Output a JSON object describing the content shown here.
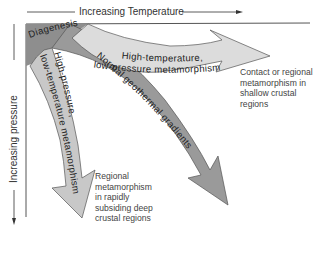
{
  "axes": {
    "x_label": "Increasing Temperature",
    "y_label": "Increasing pressure"
  },
  "regions": {
    "diagenesis": "Diagenesis"
  },
  "arrows": [
    {
      "id": "high-temp-low-pressure",
      "line1": "High-temperature,",
      "line2": "low-pressure metamorphism",
      "color": "#dcdcdc"
    },
    {
      "id": "normal-geothermal",
      "label": "Normal geothermal gradients",
      "color": "#9a9a9a"
    },
    {
      "id": "high-pressure-low-temp",
      "line1": "High-pressure,",
      "line2": "low-temperature metamorphism",
      "color": "#c8c8c8"
    }
  ],
  "notes": {
    "contact": [
      "Contact or regional",
      "metamorphism in",
      "shallow crustal",
      "regions"
    ],
    "regional": [
      "Regional",
      "metamorphism",
      "in rapidly",
      "subsiding deep",
      "crustal regions"
    ]
  },
  "colors": {
    "diagenesis_fill": "#8e8e8e",
    "outline": "#555555"
  }
}
